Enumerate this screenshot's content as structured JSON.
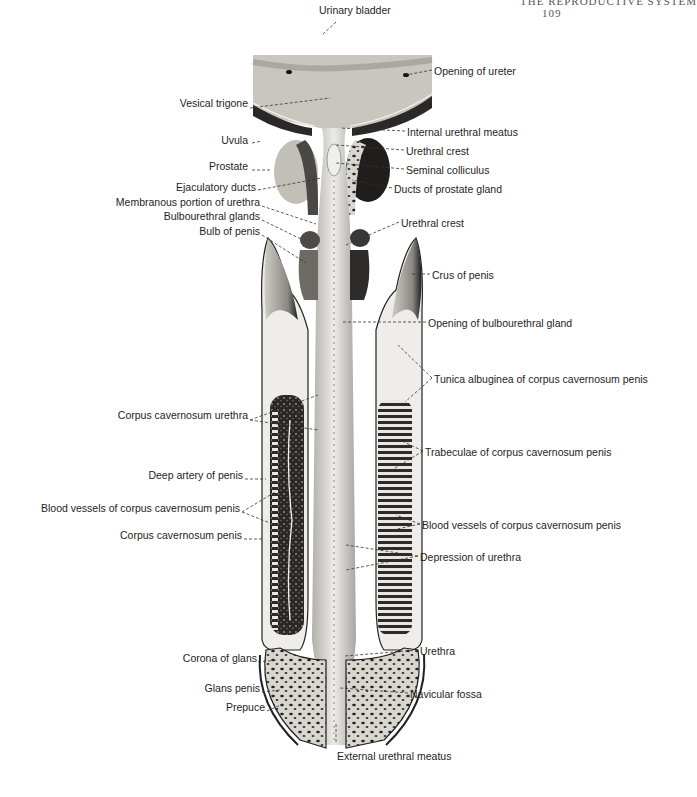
{
  "page_header": {
    "running_title": "THE REPRODUCTIVE SYSTEM",
    "page_number": "109"
  },
  "figure": {
    "labels_left": [
      {
        "id": "vesical-trigone",
        "text": "Vesical trigone",
        "x": 248,
        "y": 103
      },
      {
        "id": "uvula",
        "text": "Uvula",
        "x": 248,
        "y": 140
      },
      {
        "id": "prostate",
        "text": "Prostate",
        "x": 248,
        "y": 166
      },
      {
        "id": "ejaculatory-ducts",
        "text": "Ejaculatory ducts",
        "x": 256,
        "y": 187
      },
      {
        "id": "membranous-urethra",
        "text": "Membranous portion of urethra",
        "x": 260,
        "y": 202
      },
      {
        "id": "bulbourethral-glands",
        "text": "Bulbourethral glands",
        "x": 260,
        "y": 216
      },
      {
        "id": "bulb-of-penis",
        "text": "Bulb of penis",
        "x": 260,
        "y": 231
      },
      {
        "id": "corpus-cavernosum-urethra",
        "text": "Corpus cavernosum urethra",
        "x": 248,
        "y": 415
      },
      {
        "id": "deep-artery",
        "text": "Deep artery of penis",
        "x": 243,
        "y": 475
      },
      {
        "id": "blood-vessels-left",
        "text": "Blood vessels of corpus cavernosum penis",
        "x": 240,
        "y": 508
      },
      {
        "id": "corpus-cavernosum-penis",
        "text": "Corpus cavernosum penis",
        "x": 242,
        "y": 535
      },
      {
        "id": "corona-of-glans",
        "text": "Corona of glans",
        "x": 257,
        "y": 658
      },
      {
        "id": "glans-penis",
        "text": "Glans penis",
        "x": 260,
        "y": 688
      },
      {
        "id": "prepuce",
        "text": "Prepuce",
        "x": 265,
        "y": 707
      }
    ],
    "labels_right": [
      {
        "id": "urinary-bladder",
        "text": "Urinary bladder",
        "x": 319,
        "y": 10
      },
      {
        "id": "opening-of-ureter",
        "text": "Opening of ureter",
        "x": 434,
        "y": 65
      },
      {
        "id": "internal-urethral-meatus",
        "text": "Internal urethral meatus",
        "x": 407,
        "y": 126
      },
      {
        "id": "urethral-crest-upper",
        "text": "Urethral crest",
        "x": 406,
        "y": 145
      },
      {
        "id": "seminal-colliculus",
        "text": "Seminal colliculus",
        "x": 406,
        "y": 164
      },
      {
        "id": "ducts-of-prostate",
        "text": "Ducts of prostate gland",
        "x": 394,
        "y": 183
      },
      {
        "id": "urethral-crest-lower",
        "text": "Urethral crest",
        "x": 401,
        "y": 217
      },
      {
        "id": "crus-of-penis",
        "text": "Crus of penis",
        "x": 432,
        "y": 269
      },
      {
        "id": "opening-bulbourethral",
        "text": "Opening of bulbourethral gland",
        "x": 428,
        "y": 317
      },
      {
        "id": "tunica-albuginea",
        "text": "Tunica albuginea of corpus cavernosum penis",
        "x": 434,
        "y": 373
      },
      {
        "id": "trabeculae",
        "text": "Trabeculae of corpus cavernosum penis",
        "x": 425,
        "y": 446
      },
      {
        "id": "blood-vessels-right",
        "text": "Blood vessels of corpus cavernosum penis",
        "x": 422,
        "y": 519
      },
      {
        "id": "depression-of-urethra",
        "text": "Depression of urethra",
        "x": 420,
        "y": 551
      },
      {
        "id": "urethra",
        "text": "Urethra",
        "x": 420,
        "y": 645
      },
      {
        "id": "navicular-fossa",
        "text": "Navicular fossa",
        "x": 410,
        "y": 688
      },
      {
        "id": "external-urethral-meatus",
        "text": "External urethral meatus",
        "x": 337,
        "y": 750
      }
    ]
  },
  "colors": {
    "ink": "#1e1e1e",
    "tissue_light": "#e6e4df",
    "tissue_mid": "#b9b6b0",
    "tissue_dark": "#3a3836",
    "leader_line": "#333333"
  }
}
